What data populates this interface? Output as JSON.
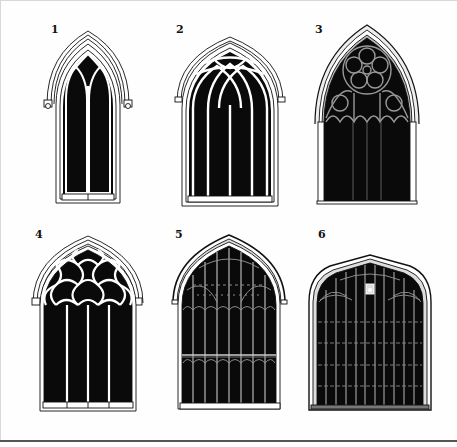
{
  "plate": {
    "title": "Gothic window tracery types",
    "figures": [
      {
        "number": "1",
        "type": "two-light lancet window with plate tracery",
        "lights": 2
      },
      {
        "number": "2",
        "type": "four-light window with intersecting Y-tracery",
        "lights": 4
      },
      {
        "number": "3",
        "type": "geometric tracery with rose/wheel oculus",
        "lights": 4
      },
      {
        "number": "4",
        "type": "four-light window with reticulated tracery",
        "lights": 4
      },
      {
        "number": "5",
        "type": "perpendicular window with transom",
        "lights": 8
      },
      {
        "number": "6",
        "type": "late perpendicular four-centred window with multiple transoms",
        "lights": 10
      }
    ]
  },
  "colors": {
    "ink": "#111111",
    "glass": "#0a0a0a",
    "stone": "#ffffff",
    "border": "#555555"
  }
}
